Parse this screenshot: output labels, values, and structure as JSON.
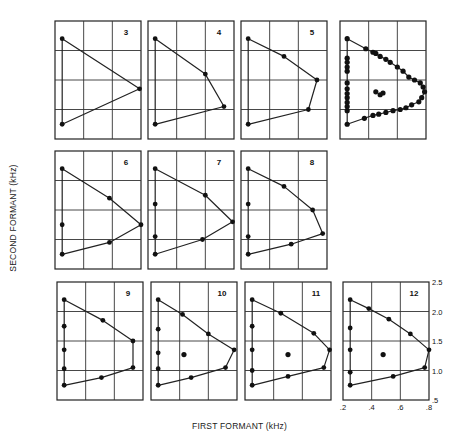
{
  "chart_data": {
    "type": "scatter",
    "title": "",
    "xlabel": "FIRST FORMANT (kHz)",
    "ylabel": "SECOND FORMANT (kHz)",
    "xlim": [
      0.2,
      0.8
    ],
    "ylim": [
      0.5,
      2.5
    ],
    "x_ticks": [
      ".2",
      ".4",
      ".6",
      ".8"
    ],
    "y_ticks": [
      ".5",
      "1.0",
      "1.5",
      "2.0",
      "2.5"
    ],
    "grid": true,
    "panels": [
      {
        "label": "3",
        "points": [
          [
            0.25,
            2.2
          ],
          [
            0.79,
            1.35
          ],
          [
            0.25,
            0.75
          ]
        ],
        "centers": []
      },
      {
        "label": "4",
        "points": [
          [
            0.25,
            2.2
          ],
          [
            0.6,
            1.6
          ],
          [
            0.73,
            1.05
          ],
          [
            0.25,
            0.75
          ]
        ],
        "centers": []
      },
      {
        "label": "5",
        "points": [
          [
            0.25,
            2.2
          ],
          [
            0.5,
            1.9
          ],
          [
            0.73,
            1.5
          ],
          [
            0.67,
            1.0
          ],
          [
            0.25,
            0.75
          ]
        ],
        "centers": []
      },
      {
        "label": "",
        "points": [
          [
            0.25,
            2.2
          ],
          [
            0.38,
            2.03
          ],
          [
            0.43,
            1.97
          ],
          [
            0.45,
            1.95
          ],
          [
            0.48,
            1.9
          ],
          [
            0.52,
            1.85
          ],
          [
            0.55,
            1.8
          ],
          [
            0.6,
            1.72
          ],
          [
            0.64,
            1.65
          ],
          [
            0.68,
            1.55
          ],
          [
            0.72,
            1.5
          ],
          [
            0.76,
            1.45
          ],
          [
            0.78,
            1.38
          ],
          [
            0.79,
            1.3
          ],
          [
            0.77,
            1.2
          ],
          [
            0.75,
            1.13
          ],
          [
            0.7,
            1.08
          ],
          [
            0.66,
            1.03
          ],
          [
            0.62,
            1.0
          ],
          [
            0.57,
            0.98
          ],
          [
            0.52,
            0.95
          ],
          [
            0.47,
            0.92
          ],
          [
            0.43,
            0.9
          ],
          [
            0.37,
            0.85
          ],
          [
            0.25,
            0.75
          ],
          [
            0.25,
            0.98
          ],
          [
            0.25,
            1.05
          ],
          [
            0.25,
            1.12
          ],
          [
            0.25,
            1.2
          ],
          [
            0.25,
            1.27
          ],
          [
            0.25,
            1.35
          ],
          [
            0.25,
            1.45
          ],
          [
            0.25,
            1.65
          ],
          [
            0.25,
            1.72
          ],
          [
            0.25,
            1.8
          ],
          [
            0.25,
            1.87
          ]
        ],
        "centers": [
          [
            0.45,
            1.3
          ],
          [
            0.48,
            1.25
          ],
          [
            0.5,
            1.28
          ]
        ]
      },
      {
        "label": "6",
        "points": [
          [
            0.25,
            2.2
          ],
          [
            0.58,
            1.7
          ],
          [
            0.8,
            1.25
          ],
          [
            0.58,
            0.95
          ],
          [
            0.25,
            0.75
          ],
          [
            0.25,
            1.25
          ]
        ],
        "centers": []
      },
      {
        "label": "7",
        "points": [
          [
            0.25,
            2.2
          ],
          [
            0.6,
            1.75
          ],
          [
            0.79,
            1.3
          ],
          [
            0.58,
            1.0
          ],
          [
            0.25,
            0.75
          ],
          [
            0.25,
            1.05
          ],
          [
            0.25,
            1.6
          ]
        ],
        "centers": []
      },
      {
        "label": "8",
        "points": [
          [
            0.25,
            2.2
          ],
          [
            0.5,
            1.9
          ],
          [
            0.7,
            1.5
          ],
          [
            0.77,
            1.1
          ],
          [
            0.55,
            0.92
          ],
          [
            0.25,
            0.75
          ],
          [
            0.25,
            1.05
          ],
          [
            0.25,
            1.6
          ]
        ],
        "centers": []
      },
      {
        "label": "9",
        "points": [
          [
            0.25,
            2.2
          ],
          [
            0.52,
            1.85
          ],
          [
            0.73,
            1.5
          ],
          [
            0.73,
            1.05
          ],
          [
            0.51,
            0.88
          ],
          [
            0.25,
            0.75
          ],
          [
            0.25,
            1.03
          ],
          [
            0.25,
            1.35
          ],
          [
            0.25,
            1.75
          ]
        ],
        "centers": []
      },
      {
        "label": "10",
        "points": [
          [
            0.25,
            2.2
          ],
          [
            0.42,
            1.95
          ],
          [
            0.6,
            1.62
          ],
          [
            0.78,
            1.35
          ],
          [
            0.72,
            1.05
          ],
          [
            0.48,
            0.88
          ],
          [
            0.25,
            0.75
          ],
          [
            0.25,
            1.03
          ],
          [
            0.25,
            1.3
          ],
          [
            0.25,
            1.7
          ]
        ],
        "centers": [
          [
            0.43,
            1.27
          ]
        ]
      },
      {
        "label": "11",
        "points": [
          [
            0.25,
            2.2
          ],
          [
            0.45,
            1.97
          ],
          [
            0.68,
            1.63
          ],
          [
            0.79,
            1.35
          ],
          [
            0.75,
            1.05
          ],
          [
            0.5,
            0.9
          ],
          [
            0.25,
            0.75
          ],
          [
            0.25,
            1.0
          ],
          [
            0.25,
            1.35
          ],
          [
            0.25,
            1.75
          ]
        ],
        "centers": [
          [
            0.5,
            1.27
          ]
        ]
      },
      {
        "label": "12",
        "points": [
          [
            0.25,
            2.2
          ],
          [
            0.38,
            2.05
          ],
          [
            0.52,
            1.87
          ],
          [
            0.67,
            1.62
          ],
          [
            0.8,
            1.35
          ],
          [
            0.77,
            1.05
          ],
          [
            0.55,
            0.9
          ],
          [
            0.25,
            0.75
          ],
          [
            0.25,
            0.97
          ],
          [
            0.25,
            1.35
          ],
          [
            0.25,
            1.72
          ]
        ],
        "centers": [
          [
            0.48,
            1.27
          ]
        ]
      }
    ]
  },
  "axes": {
    "xlabel": "FIRST FORMANT (kHz)",
    "ylabel": "SECOND FORMANT (kHz)"
  }
}
